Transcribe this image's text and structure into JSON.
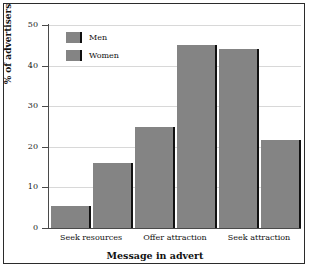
{
  "chart_data": {
    "type": "bar",
    "title": "",
    "categories": [
      "Seek resources",
      "Offer attraction",
      "Seek attraction"
    ],
    "series": [
      {
        "name": "Men",
        "values": [
          5.5,
          25,
          44
        ]
      },
      {
        "name": "Women",
        "values": [
          16,
          45,
          21.7
        ]
      }
    ],
    "xlabel": "Message in advert",
    "ylabel": "% of advertisers",
    "ylim": [
      0,
      50
    ],
    "yticks": [
      0,
      10,
      20,
      30,
      40,
      50
    ],
    "ytick_labels": [
      "0",
      "10",
      "20",
      "30",
      "40",
      "50"
    ],
    "grid": true,
    "legend_position": "top-left",
    "bar_color": "#848484",
    "bar_shadow_color": "#111111",
    "gridline_color": "#d8d8d8",
    "axis_color": "#4a4a4a",
    "frame_color": "#2b2b2b"
  }
}
